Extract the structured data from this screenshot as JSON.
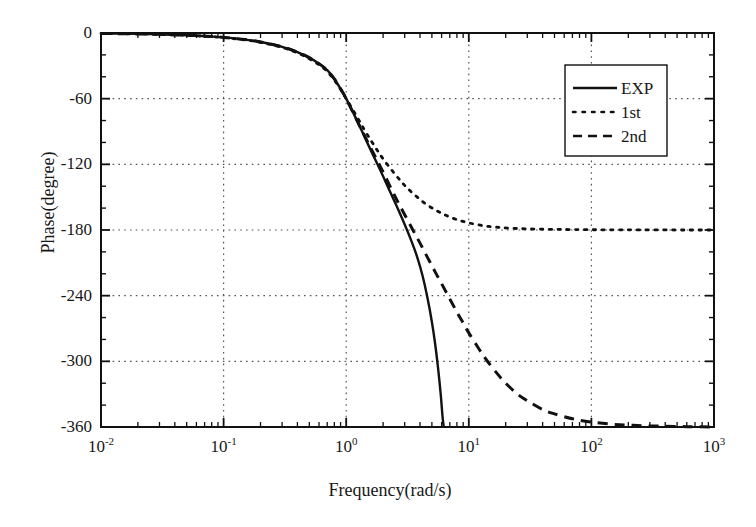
{
  "chart_data": {
    "type": "line",
    "title": "",
    "xlabel": "Frequency(rad/s)",
    "ylabel": "Phase(degree)",
    "xscale": "log",
    "yscale": "linear",
    "xlim": [
      0.01,
      1000
    ],
    "ylim": [
      -360,
      0
    ],
    "grid": true,
    "grid_style": "dotted",
    "legend_position": "upper right",
    "xticks": [
      {
        "value": 0.01,
        "mantissa": "10",
        "exponent": "-2"
      },
      {
        "value": 0.1,
        "mantissa": "10",
        "exponent": "-1"
      },
      {
        "value": 1,
        "mantissa": "10",
        "exponent": "0"
      },
      {
        "value": 10,
        "mantissa": "10",
        "exponent": "1"
      },
      {
        "value": 100,
        "mantissa": "10",
        "exponent": "2"
      },
      {
        "value": 1000,
        "mantissa": "10",
        "exponent": "3"
      }
    ],
    "yticks": [
      0,
      -60,
      -120,
      -180,
      -240,
      -300,
      -360
    ],
    "ytick_labels": [
      "0",
      "-60",
      "-120",
      "-180",
      "-240",
      "-300",
      "-360"
    ],
    "series": [
      {
        "name": "EXP",
        "style": "solid",
        "color": "#111111",
        "points": [
          [
            0.01,
            -0.4
          ],
          [
            0.02,
            -0.8
          ],
          [
            0.03,
            -1.2
          ],
          [
            0.05,
            -2.0
          ],
          [
            0.07,
            -2.8
          ],
          [
            0.1,
            -4.0
          ],
          [
            0.15,
            -6.0
          ],
          [
            0.2,
            -8.2
          ],
          [
            0.3,
            -12.6
          ],
          [
            0.4,
            -17.4
          ],
          [
            0.5,
            -22.5
          ],
          [
            0.6,
            -28.0
          ],
          [
            0.7,
            -34.0
          ],
          [
            0.8,
            -42.0
          ],
          [
            0.9,
            -51.0
          ],
          [
            1.0,
            -60.0
          ],
          [
            1.2,
            -78.0
          ],
          [
            1.4,
            -94.0
          ],
          [
            1.6,
            -108.0
          ],
          [
            1.8,
            -120.0
          ],
          [
            2.0,
            -131.0
          ],
          [
            2.3,
            -146.0
          ],
          [
            2.6,
            -159.0
          ],
          [
            3.0,
            -175.0
          ],
          [
            3.4,
            -190.0
          ],
          [
            3.8,
            -205.0
          ],
          [
            4.2,
            -222.0
          ],
          [
            4.6,
            -242.0
          ],
          [
            5.0,
            -264.0
          ],
          [
            5.3,
            -283.0
          ],
          [
            5.6,
            -305.0
          ],
          [
            5.9,
            -330.0
          ],
          [
            6.1,
            -350.0
          ],
          [
            6.25,
            -360.0
          ]
        ]
      },
      {
        "name": "1st",
        "style": "dotted",
        "color": "#111111",
        "points": [
          [
            0.01,
            -0.4
          ],
          [
            0.02,
            -0.8
          ],
          [
            0.03,
            -1.3
          ],
          [
            0.05,
            -2.1
          ],
          [
            0.07,
            -3.0
          ],
          [
            0.1,
            -4.2
          ],
          [
            0.15,
            -6.3
          ],
          [
            0.2,
            -8.6
          ],
          [
            0.3,
            -13.2
          ],
          [
            0.4,
            -18.2
          ],
          [
            0.5,
            -23.5
          ],
          [
            0.6,
            -29.0
          ],
          [
            0.7,
            -35.2
          ],
          [
            0.8,
            -43.0
          ],
          [
            0.9,
            -51.5
          ],
          [
            1.0,
            -60.0
          ],
          [
            1.2,
            -75.0
          ],
          [
            1.4,
            -88.0
          ],
          [
            1.6,
            -98.5
          ],
          [
            1.8,
            -107.5
          ],
          [
            2.0,
            -115.0
          ],
          [
            2.4,
            -126.5
          ],
          [
            2.8,
            -135.5
          ],
          [
            3.2,
            -142.5
          ],
          [
            3.8,
            -150.0
          ],
          [
            4.5,
            -156.5
          ],
          [
            5.5,
            -162.5
          ],
          [
            6.5,
            -166.5
          ],
          [
            8.0,
            -170.5
          ],
          [
            10.0,
            -173.5
          ],
          [
            13.0,
            -176.0
          ],
          [
            17.0,
            -177.5
          ],
          [
            22.0,
            -178.4
          ],
          [
            30.0,
            -179.0
          ],
          [
            45.0,
            -179.4
          ],
          [
            70.0,
            -179.6
          ],
          [
            120.0,
            -179.8
          ],
          [
            250.0,
            -179.9
          ],
          [
            600.0,
            -180.0
          ],
          [
            1000.0,
            -180.0
          ]
        ]
      },
      {
        "name": "2nd",
        "style": "dashed",
        "color": "#111111",
        "points": [
          [
            0.01,
            -0.4
          ],
          [
            0.02,
            -0.8
          ],
          [
            0.03,
            -1.2
          ],
          [
            0.05,
            -2.0
          ],
          [
            0.07,
            -2.8
          ],
          [
            0.1,
            -4.0
          ],
          [
            0.15,
            -6.0
          ],
          [
            0.2,
            -8.2
          ],
          [
            0.3,
            -12.6
          ],
          [
            0.4,
            -17.4
          ],
          [
            0.5,
            -22.5
          ],
          [
            0.6,
            -28.0
          ],
          [
            0.7,
            -34.0
          ],
          [
            0.8,
            -42.0
          ],
          [
            0.9,
            -51.0
          ],
          [
            1.0,
            -60.0
          ],
          [
            1.2,
            -78.0
          ],
          [
            1.4,
            -93.0
          ],
          [
            1.6,
            -106.0
          ],
          [
            1.8,
            -117.0
          ],
          [
            2.0,
            -127.0
          ],
          [
            2.3,
            -141.0
          ],
          [
            2.6,
            -153.0
          ],
          [
            3.0,
            -166.0
          ],
          [
            3.5,
            -180.0
          ],
          [
            4.0,
            -192.0
          ],
          [
            4.6,
            -205.0
          ],
          [
            5.3,
            -218.0
          ],
          [
            6.0,
            -229.0
          ],
          [
            7.0,
            -243.0
          ],
          [
            8.0,
            -255.0
          ],
          [
            9.0,
            -265.0
          ],
          [
            10.0,
            -274.0
          ],
          [
            12.0,
            -288.0
          ],
          [
            14.0,
            -299.0
          ],
          [
            17.0,
            -311.0
          ],
          [
            20.0,
            -320.0
          ],
          [
            25.0,
            -330.0
          ],
          [
            30.0,
            -336.0
          ],
          [
            40.0,
            -344.0
          ],
          [
            50.0,
            -348.0
          ],
          [
            70.0,
            -352.5
          ],
          [
            100.0,
            -355.5
          ],
          [
            150.0,
            -357.5
          ],
          [
            220.0,
            -358.5
          ],
          [
            350.0,
            -359.2
          ],
          [
            600.0,
            -359.7
          ],
          [
            1000.0,
            -360.0
          ]
        ]
      }
    ]
  },
  "legend": {
    "entries": [
      {
        "label": "EXP",
        "style": "solid"
      },
      {
        "label": "1st",
        "style": "dotted"
      },
      {
        "label": "2nd",
        "style": "dashed"
      }
    ]
  },
  "axes": {
    "x_title": "Frequency(rad/s)",
    "y_title": "Phase(degree)"
  }
}
